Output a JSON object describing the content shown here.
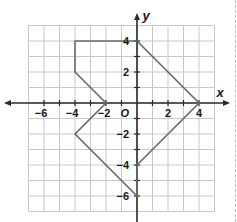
{
  "chart_data": {
    "type": "line",
    "title": "",
    "xlabel": "x",
    "ylabel": "y",
    "origin_label": "O",
    "xlim": [
      -7,
      5
    ],
    "ylim": [
      -7,
      5
    ],
    "grid": true,
    "x_ticks": [
      -6,
      -4,
      -2,
      2,
      4
    ],
    "y_ticks": [
      4,
      2,
      -2,
      -4,
      -6
    ],
    "x_tick_labels": [
      "−6",
      "−4",
      "−2",
      "2",
      "4"
    ],
    "y_tick_labels": [
      "4",
      "2",
      "−2",
      "−4",
      "−6"
    ],
    "series": [
      {
        "name": "polygon",
        "closed": true,
        "points": [
          [
            0,
            4
          ],
          [
            4,
            0
          ],
          [
            0,
            -4
          ],
          [
            0,
            -6
          ],
          [
            -4,
            -2
          ],
          [
            -2,
            0
          ],
          [
            -4,
            2
          ],
          [
            -4,
            4
          ]
        ]
      }
    ]
  },
  "colors": {
    "grid": "#c8c8c8",
    "axis": "#2a2a2a",
    "polygon": "#6a6a6a",
    "text": "#1a1a1a"
  }
}
